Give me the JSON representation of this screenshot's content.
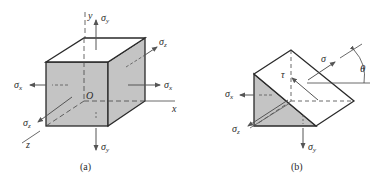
{
  "figure_a": {
    "caption": "(a)",
    "axes": {
      "x": "x",
      "y": "y",
      "z": "z",
      "origin": "O"
    },
    "labels": {
      "sigma": "σ",
      "sigma_y_top_sub": "y",
      "sigma_y_bottom_sub": "y",
      "sigma_x_left_sub": "x",
      "sigma_x_right_sub": "x",
      "sigma_z_back_sub": "z",
      "sigma_z_front_sub": "z"
    }
  },
  "figure_b": {
    "caption": "(b)",
    "labels": {
      "sigma": "σ",
      "tau": "τ",
      "theta": "θ",
      "sigma_x_sub": "x",
      "sigma_z_sub": "z",
      "sigma_y_sub": "y"
    }
  },
  "colors": {
    "face_fill": "#c4c4c4",
    "line": "#2a2a2a",
    "arrow": "#555555"
  }
}
